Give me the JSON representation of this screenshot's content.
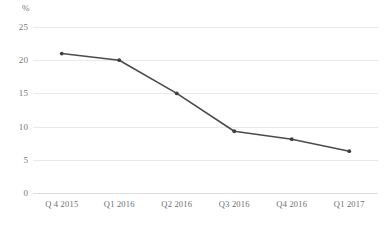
{
  "chart_data": {
    "type": "line",
    "title": "",
    "subtitle": "",
    "xlabel": "",
    "ylabel": "",
    "unit_label": "%",
    "categories": [
      "Q 4 2015",
      "Q1 2016",
      "Q2 2016",
      "Q3 2016",
      "Q4 2016",
      "Q1 2017"
    ],
    "values": [
      21.0,
      20.0,
      15.0,
      9.3,
      8.1,
      6.3
    ],
    "series": [
      {
        "name": "",
        "values": [
          21.0,
          20.0,
          15.0,
          9.3,
          8.1,
          6.3
        ]
      }
    ],
    "ylim": [
      0,
      25
    ],
    "ytick_labels": [
      "0",
      "5",
      "10",
      "15",
      "20",
      "25"
    ],
    "ytick_values": [
      0,
      5,
      10,
      15,
      20,
      25
    ],
    "grid": true,
    "grid_axis": "y",
    "legend": false,
    "legend_position": "none",
    "markers": true,
    "line_color": "#4b4b4b",
    "marker_color": "#3f3f3f",
    "grid_color": "#e9e9e9",
    "axis_text_color": "#777777",
    "background_color": "#ffffff"
  }
}
